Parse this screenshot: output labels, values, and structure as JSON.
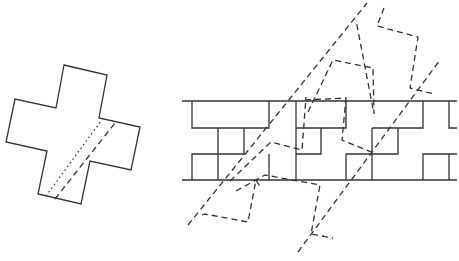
{
  "diagram": {
    "colors": {
      "stroke": "#333333",
      "background": "#ffffff"
    },
    "cross": {
      "points": "64,65 107,75 99,118 140,127 131,170 90,161 81,204 38,194 47,151 6,142 15,99 56,108",
      "dotted_line": {
        "x1": 46,
        "y1": 196,
        "x2": 101,
        "y2": 121
      },
      "dashed_line": {
        "x1": 55,
        "y1": 199,
        "x2": 115,
        "y2": 123
      }
    },
    "band": {
      "top_y": 101,
      "bottom_y": 180,
      "x_start": 182,
      "x_end": 457
    },
    "dashed_strip": {
      "left_line": {
        "x1": 188,
        "y1": 225,
        "x2": 367,
        "y2": 3
      },
      "right_line": {
        "x1": 298,
        "y1": 252,
        "x2": 440,
        "y2": 60
      }
    }
  }
}
